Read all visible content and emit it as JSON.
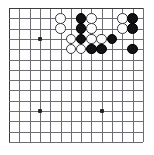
{
  "diagram": {
    "kind": "go-board-diagram",
    "board": {
      "visible_columns": 14,
      "visible_rows": 14,
      "origin_x": 9,
      "origin_y": 8,
      "spacing": 10.3,
      "line_color": "#6d6d73",
      "edge_color": "#3c3c40",
      "background_color": "#ffffff"
    },
    "stone_radius": 5.3,
    "colors": {
      "black_stone": "#121214",
      "white_stone": "#fdfdfd",
      "white_stone_border": "#3a3a3e",
      "star_point": "#26262a"
    },
    "star_points": [
      {
        "col": 3,
        "row": 3
      },
      {
        "col": 3,
        "row": 10
      },
      {
        "col": 9,
        "row": 10
      }
    ],
    "stones": [
      {
        "color": "white",
        "col": 5,
        "row": 1
      },
      {
        "color": "black",
        "col": 7,
        "row": 1
      },
      {
        "color": "white",
        "col": 8,
        "row": 1
      },
      {
        "color": "white",
        "col": 11,
        "row": 1
      },
      {
        "color": "black",
        "col": 12,
        "row": 1
      },
      {
        "color": "white",
        "col": 5,
        "row": 2
      },
      {
        "color": "black",
        "col": 7,
        "row": 2
      },
      {
        "color": "white",
        "col": 8,
        "row": 2
      },
      {
        "color": "white",
        "col": 11,
        "row": 2
      },
      {
        "color": "black",
        "col": 12,
        "row": 2
      },
      {
        "color": "white",
        "col": 6,
        "row": 3
      },
      {
        "color": "black",
        "col": 7,
        "row": 3
      },
      {
        "color": "white",
        "col": 8,
        "row": 3
      },
      {
        "color": "white",
        "col": 9,
        "row": 3
      },
      {
        "color": "black",
        "col": 10,
        "row": 3
      },
      {
        "color": "white",
        "col": 6,
        "row": 4
      },
      {
        "color": "white",
        "col": 7,
        "row": 4
      },
      {
        "color": "black",
        "col": 8,
        "row": 4
      },
      {
        "color": "black",
        "col": 9,
        "row": 4
      },
      {
        "color": "black",
        "col": 12,
        "row": 4
      }
    ],
    "counts": {
      "black_stones": 9,
      "white_stones": 11,
      "total_stones": 20
    }
  }
}
